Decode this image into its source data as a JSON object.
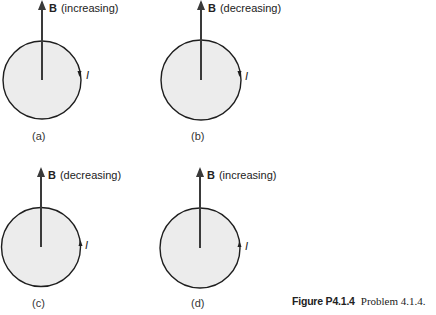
{
  "figure": {
    "caption_label": "Figure P4.1.4",
    "caption_text": "Problem 4.1.4.",
    "panels": [
      {
        "id": "a",
        "sublabel": "(a)",
        "field_symbol": "B",
        "field_state": "(increasing)",
        "current_symbol": "I",
        "current_direction": "clockwise-down"
      },
      {
        "id": "b",
        "sublabel": "(b)",
        "field_symbol": "B",
        "field_state": "(decreasing)",
        "current_symbol": "I",
        "current_direction": "clockwise-down"
      },
      {
        "id": "c",
        "sublabel": "(c)",
        "field_symbol": "B",
        "field_state": "(decreasing)",
        "current_symbol": "I",
        "current_direction": "counterclockwise-up"
      },
      {
        "id": "d",
        "sublabel": "(d)",
        "field_symbol": "B",
        "field_state": "(increasing)",
        "current_symbol": "I",
        "current_direction": "counterclockwise-up"
      }
    ]
  },
  "colors": {
    "loop_fill": "#ececec",
    "loop_stroke": "#1e1e1e",
    "arrow": "#3a3a3a"
  }
}
